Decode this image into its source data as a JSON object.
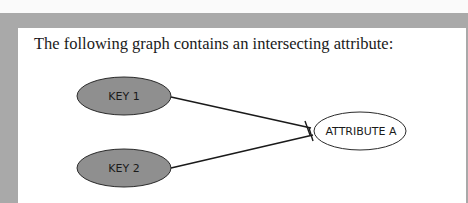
{
  "intro_text": "The following graph contains an intersecting attribute:",
  "diagram": {
    "nodes": [
      {
        "id": "key1",
        "label": "KEY 1",
        "shape": "ellipse",
        "fill": "#8f8f8f"
      },
      {
        "id": "key2",
        "label": "KEY 2",
        "shape": "ellipse",
        "fill": "#8f8f8f"
      },
      {
        "id": "attrA",
        "label": "ATTRIBUTE A",
        "shape": "ellipse",
        "fill": "#ffffff"
      }
    ],
    "edges": [
      {
        "from": "key1",
        "to": "attrA",
        "end_marker": "bar"
      },
      {
        "from": "key2",
        "to": "attrA",
        "end_marker": "bar"
      }
    ]
  },
  "colors": {
    "frame": "#a9a9a9",
    "key_fill": "#8f8f8f"
  }
}
